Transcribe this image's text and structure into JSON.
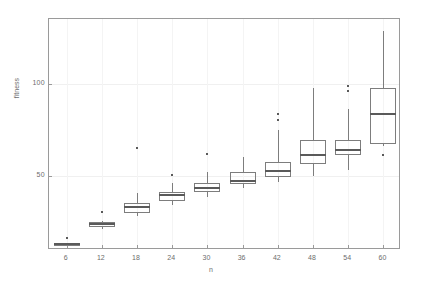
{
  "chart_data": {
    "type": "box",
    "title": "",
    "xlabel": "n",
    "ylabel": "fitness",
    "categories": [
      6,
      12,
      18,
      24,
      30,
      36,
      42,
      48,
      54,
      60
    ],
    "xtick_labels": [
      "6",
      "12",
      "18",
      "24",
      "30",
      "36",
      "42",
      "48",
      "54",
      "60"
    ],
    "ytick_labels": [
      "100",
      "50"
    ],
    "ytick_values": [
      100,
      50
    ],
    "ylim": [
      10,
      135
    ],
    "xlim": [
      3,
      63
    ],
    "grid": true,
    "legend": null,
    "boxes": [
      {
        "category": "6",
        "min": 13.5,
        "q1": 13.5,
        "median": 13.5,
        "q3": 13.5,
        "max": 13.5,
        "outliers": [
          16.5
        ]
      },
      {
        "category": "12",
        "min": 21.5,
        "q1": 22.5,
        "median": 24.0,
        "q3": 25.0,
        "max": 25.5,
        "outliers": [
          30.5
        ]
      },
      {
        "category": "18",
        "min": 28.5,
        "q1": 30.0,
        "median": 33.0,
        "q3": 35.5,
        "max": 41.0,
        "outliers": [
          65.0
        ]
      },
      {
        "category": "24",
        "min": 34.5,
        "q1": 36.5,
        "median": 39.5,
        "q3": 41.5,
        "max": 46.5,
        "outliers": [
          50.5
        ]
      },
      {
        "category": "30",
        "min": 38.5,
        "q1": 41.5,
        "median": 43.5,
        "q3": 46.0,
        "max": 52.0,
        "outliers": [
          62.0
        ]
      },
      {
        "category": "36",
        "min": 43.5,
        "q1": 45.5,
        "median": 47.5,
        "q3": 52.0,
        "max": 60.5,
        "outliers": []
      },
      {
        "category": "42",
        "min": 47.0,
        "q1": 49.5,
        "median": 52.5,
        "q3": 57.5,
        "max": 75.0,
        "outliers": [
          80.5,
          83.5
        ]
      },
      {
        "category": "48",
        "min": 50.0,
        "q1": 56.5,
        "median": 61.5,
        "q3": 69.5,
        "max": 97.5,
        "outliers": []
      },
      {
        "category": "54",
        "min": 53.5,
        "q1": 61.5,
        "median": 64.0,
        "q3": 69.5,
        "max": 86.5,
        "outliers": [
          96.0,
          98.5
        ]
      },
      {
        "category": "60",
        "min": 66.5,
        "q1": 67.5,
        "median": 83.5,
        "q3": 97.5,
        "max": 128.5,
        "outliers": [
          61.5
        ]
      }
    ]
  }
}
